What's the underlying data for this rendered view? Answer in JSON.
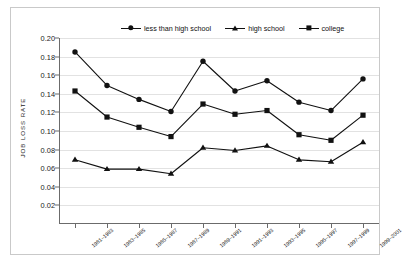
{
  "chart_data": {
    "type": "line",
    "title": "",
    "xlabel": "",
    "ylabel": "JOB LOSS RATE",
    "ylim": [
      0,
      0.2
    ],
    "ytick_values": [
      0.02,
      0.04,
      0.06,
      0.08,
      0.1,
      0.12,
      0.14,
      0.16,
      0.18,
      0.2
    ],
    "ytick_labels": [
      "0.02",
      "0.04",
      "0.06",
      "0.08",
      "0.10",
      "0.12",
      "0.14",
      "0.16",
      "0.18",
      "0.20"
    ],
    "grid": true,
    "legend_position": "top",
    "categories": [
      "1981–1983",
      "1983–1985",
      "1985–1987",
      "1987–1989",
      "1989–1991",
      "1991–1993",
      "1993–1995",
      "1995–1997",
      "1997–1999",
      "1999–2001"
    ],
    "series": [
      {
        "name": "less than high school",
        "marker": "circle",
        "color": "#111111",
        "values": [
          0.185,
          0.149,
          0.134,
          0.121,
          0.175,
          0.143,
          0.154,
          0.131,
          0.122,
          0.156
        ]
      },
      {
        "name": "high school",
        "marker": "square",
        "color": "#111111",
        "values": [
          0.143,
          0.115,
          0.104,
          0.094,
          0.129,
          0.118,
          0.122,
          0.096,
          0.09,
          0.117
        ]
      },
      {
        "name": "college",
        "marker": "triangle",
        "color": "#111111",
        "values": [
          0.069,
          0.059,
          0.059,
          0.054,
          0.082,
          0.079,
          0.084,
          0.069,
          0.067,
          0.088
        ]
      }
    ]
  },
  "legend": {
    "items": [
      {
        "label": "less than high school",
        "marker": "circle"
      },
      {
        "label": "high school",
        "marker": "triangle"
      },
      {
        "label": "college",
        "marker": "square"
      }
    ]
  },
  "axes": {
    "y_title": "JOB LOSS RATE"
  },
  "colors": {
    "ink": "#111111",
    "grid": "#e2e2e2",
    "axis": "#6b6b6b",
    "frame": "#c9c9c9",
    "background": "#ffffff"
  }
}
